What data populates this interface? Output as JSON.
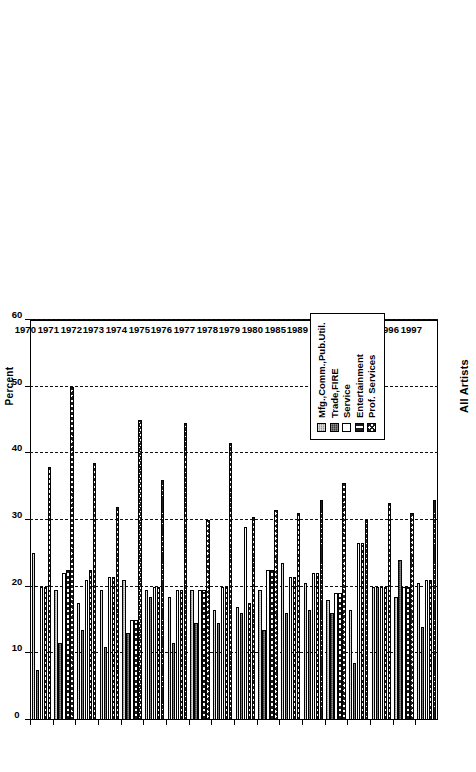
{
  "chart_data": {
    "type": "bar",
    "orientation": "horizontal",
    "title": "All Artists",
    "xlabel": "Percent",
    "ylabel": "",
    "xlim": [
      0,
      60
    ],
    "xticks": [
      0,
      10,
      20,
      30,
      40,
      50,
      60
    ],
    "grid": "vertical-dashed",
    "legend_position": "bottom-right",
    "categories": [
      "1970",
      "1971",
      "1972",
      "1973",
      "1974",
      "1975",
      "1976",
      "1977",
      "1978",
      "1979",
      "1980",
      "1985",
      "1989",
      "1991",
      "1994",
      "1995",
      "1996",
      "1997"
    ],
    "series": [
      {
        "name": "Mfg.,Comm.,Pub.Util.",
        "pattern": "light-grey-stipple",
        "color": "#b9b9b9",
        "values": [
          25.0,
          19.5,
          17.5,
          19.5,
          21.0,
          19.5,
          18.5,
          19.5,
          16.5,
          17.0,
          19.5,
          23.5,
          20.5,
          18.0,
          16.5,
          20.0,
          18.5,
          20.5
        ]
      },
      {
        "name": "Trade,FIRE",
        "pattern": "dark-stipple",
        "color": "#3a3a3a",
        "values": [
          7.5,
          11.5,
          13.5,
          11.0,
          13.0,
          18.5,
          11.5,
          14.5,
          14.5,
          16.0,
          13.5,
          16.0,
          16.5,
          16.0,
          8.5,
          20.0,
          24.0,
          14.0
        ]
      },
      {
        "name": "Service",
        "pattern": "white",
        "color": "#ffffff",
        "values": [
          20.0,
          22.0,
          21.0,
          21.5,
          15.0,
          20.0,
          19.5,
          19.5,
          20.0,
          29.0,
          22.5,
          21.5,
          22.0,
          19.0,
          26.5,
          20.0,
          20.0,
          21.0
        ]
      },
      {
        "name": "Entertainment",
        "pattern": "vertical-bars",
        "color": "#1a1a1a",
        "values": [
          20.0,
          22.5,
          22.5,
          21.5,
          15.0,
          20.0,
          19.5,
          19.5,
          20.0,
          17.5,
          22.5,
          21.5,
          22.0,
          19.0,
          26.5,
          20.0,
          20.0,
          21.0
        ]
      },
      {
        "name": "Prof. Services",
        "pattern": "diagonal-crosshatch",
        "color": "#1d1d1d",
        "values": [
          38.0,
          50.0,
          38.5,
          32.0,
          45.0,
          36.0,
          44.5,
          30.0,
          41.5,
          30.5,
          31.5,
          31.0,
          33.0,
          35.5,
          30.0,
          32.5,
          31.0,
          33.0
        ]
      }
    ]
  },
  "legend": {
    "items": [
      {
        "label": "Mfg.,Comm.,Pub.Util."
      },
      {
        "label": "Trade,FIRE"
      },
      {
        "label": "Service"
      },
      {
        "label": "Entertainment"
      },
      {
        "label": "Prof. Services"
      }
    ]
  }
}
